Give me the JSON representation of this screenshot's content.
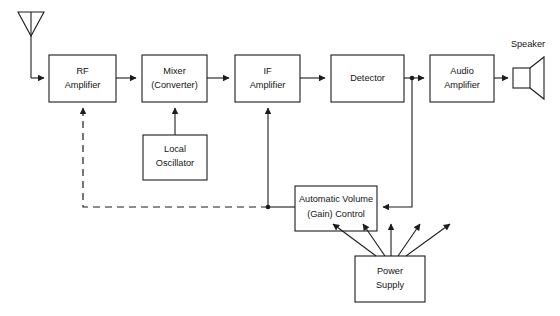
{
  "diagram": {
    "background_color": "#ffffff",
    "line_color": "#1c1c1c",
    "blocks": [
      {
        "id": "rf_amplifier",
        "line1": "RF",
        "line2": "Amplifier"
      },
      {
        "id": "mixer",
        "line1": "Mixer",
        "line2": "(Converter)"
      },
      {
        "id": "if_amplifier",
        "line1": "IF",
        "line2": "Amplifier"
      },
      {
        "id": "detector",
        "line1": "Detector",
        "line2": ""
      },
      {
        "id": "audio_amplifier",
        "line1": "Audio",
        "line2": "Amplifier"
      },
      {
        "id": "local_oscillator",
        "line1": "Local",
        "line2": "Oscillator"
      },
      {
        "id": "avc",
        "line1": "Automatic Volume",
        "line2": "(Gain) Control"
      },
      {
        "id": "power_supply",
        "line1": "Power",
        "line2": "Supply"
      }
    ],
    "external_labels": [
      {
        "id": "speaker",
        "text": "Speaker"
      }
    ]
  }
}
